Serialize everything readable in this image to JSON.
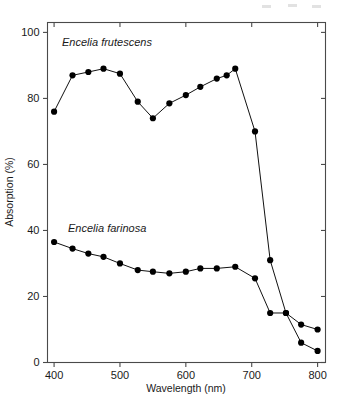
{
  "figure": {
    "name": "absorption-spectrum-figure",
    "background": "#ffffff",
    "ink_color": "#111111",
    "axis_color": "#4a4a4a"
  },
  "axes": {
    "x_title": "Wavelength (nm)",
    "y_title": "Absorption (%)",
    "x_ticks": [
      "400",
      "500",
      "600",
      "700",
      "800"
    ],
    "y_ticks": [
      "0",
      "20",
      "40",
      "60",
      "80",
      "100"
    ]
  },
  "labels": {
    "series_top": "Encelia frutescens",
    "series_bottom": "Encelia farinosa"
  },
  "chart_data": {
    "type": "line",
    "title": "",
    "xlabel": "Wavelength (nm)",
    "ylabel": "Absorption (%)",
    "xlim": [
      390,
      812
    ],
    "ylim": [
      0,
      103
    ],
    "xticks": [
      400,
      500,
      600,
      700,
      800
    ],
    "yticks": [
      0,
      20,
      40,
      60,
      80,
      100
    ],
    "grid": false,
    "legend": "inline-annotation",
    "marker": "filled-circle",
    "series": [
      {
        "name": "Encelia frutescens",
        "label_position": "upper-left",
        "x": [
          400,
          428,
          452,
          475,
          500,
          527,
          550,
          575,
          600,
          622,
          647,
          662,
          675,
          705,
          728,
          752,
          775,
          800
        ],
        "y": [
          76,
          87,
          88,
          89,
          87.5,
          79,
          74,
          78.5,
          81,
          83.5,
          86,
          87,
          89,
          70,
          31,
          15,
          11.5,
          10
        ]
      },
      {
        "name": "Encelia farinosa",
        "label_position": "mid-left",
        "x": [
          400,
          428,
          452,
          475,
          500,
          527,
          550,
          575,
          600,
          622,
          647,
          675,
          705,
          728,
          752,
          775,
          800
        ],
        "y": [
          36.5,
          34.5,
          33,
          32,
          30,
          28,
          27.5,
          27,
          27.5,
          28.5,
          28.5,
          29,
          25.5,
          15,
          15,
          6,
          3.5
        ]
      }
    ],
    "notes": [
      "Both taxa show a steep absorption decline beyond 700 nm.",
      "E. frutescens absorbs 74-89% across 400-675 nm.",
      "E. farinosa absorbs only 26-37% across the visible range."
    ]
  }
}
